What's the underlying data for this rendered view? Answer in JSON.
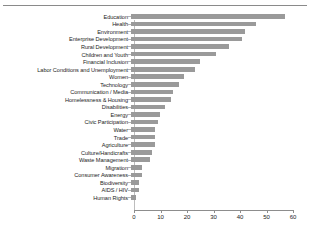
{
  "chart_data": {
    "type": "bar",
    "orientation": "horizontal",
    "title": "",
    "xlabel": "",
    "ylabel": "",
    "xlim": [
      0,
      60
    ],
    "xticks": [
      0,
      10,
      20,
      30,
      40,
      50,
      60
    ],
    "grid": false,
    "legend": null,
    "bar_color": "#9a9a9a",
    "categories": [
      "Education",
      "Health",
      "Environment",
      "Enterprise Development",
      "Rural Development",
      "Children and Youth",
      "Financial Inclusion",
      "Labor Conditions and Unemployment",
      "Women",
      "Technology",
      "Communication / Media",
      "Homelessness & Housing",
      "Disabilities",
      "Energy",
      "Civic Participation",
      "Water",
      "Trade",
      "Agriculture",
      "Culture/Handicrafts",
      "Waste Management",
      "Migration",
      "Consumer Awareness",
      "Biodiversity",
      "AIDS / HIV",
      "Human Rights"
    ],
    "values": [
      58,
      47,
      43,
      42,
      37,
      32,
      26,
      24,
      20,
      18,
      16,
      15,
      13,
      11,
      10,
      9,
      9,
      9,
      8,
      7,
      4,
      4,
      3,
      3,
      2
    ]
  }
}
